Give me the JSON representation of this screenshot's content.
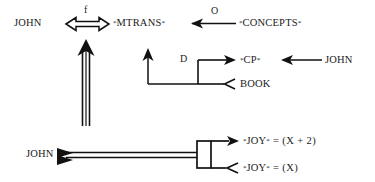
{
  "diagram": {
    "kind": "conceptual-dependency-diagram",
    "background_color": "#ffffff",
    "ink_color": "#111111",
    "nodes": {
      "john_top": "JOHN",
      "mtrans": {
        "open": "*",
        "name": "MTRANS",
        "close": "*"
      },
      "concepts": {
        "open": "*",
        "name": "CONCEPTS",
        "close": "*"
      },
      "cp": {
        "open": "*",
        "name": "CP",
        "close": "*"
      },
      "book": "BOOK",
      "john_right": "JOHN",
      "john_bottom": "JOHN",
      "joy_plus": {
        "open": "*",
        "name": "JOY",
        "close": "*",
        "equals": "=",
        "value": "(X + 2)"
      },
      "joy_base": {
        "open": "*",
        "name": "JOY",
        "close": "*",
        "equals": "=",
        "value": "(X)"
      }
    },
    "edge_labels": {
      "f": "f",
      "o": "O",
      "d": "D"
    }
  }
}
